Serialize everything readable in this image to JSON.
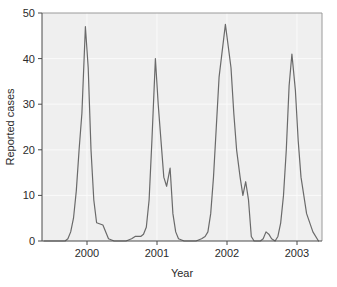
{
  "chart_data": {
    "type": "line",
    "title": "",
    "subtitle": "",
    "xlabel": "Year",
    "ylabel": "Reported cases",
    "xlim": [
      1999.55,
      2003.55
    ],
    "ylim": [
      0,
      50
    ],
    "grid": true,
    "legend": null,
    "legend_position": "none",
    "x_tick_labels": [
      "2000",
      "2001",
      "2002",
      "2003"
    ],
    "x_tick_values": [
      2000,
      2001,
      2002,
      2003
    ],
    "y_tick_labels": [
      "0",
      "10",
      "20",
      "30",
      "40",
      "50"
    ],
    "y_tick_values": [
      0,
      10,
      20,
      30,
      40,
      50
    ],
    "line_color": "#6a6a6a",
    "plot_background_color": "#efefef",
    "series": [
      {
        "name": "Reported cases",
        "x": [
          1999.58,
          1999.67,
          1999.75,
          1999.83,
          1999.88,
          1999.92,
          1999.96,
          2000.0,
          2000.04,
          2000.08,
          2000.12,
          2000.17,
          2000.21,
          2000.25,
          2000.29,
          2000.33,
          2000.42,
          2000.5,
          2000.58,
          2000.67,
          2000.75,
          2000.83,
          2000.88,
          2000.92,
          2000.96,
          2001.0,
          2001.04,
          2001.08,
          2001.12,
          2001.17,
          2001.21,
          2001.25,
          2001.29,
          2001.33,
          2001.38,
          2001.42,
          2001.46,
          2001.5,
          2001.58,
          2001.67,
          2001.75,
          2001.83,
          2001.88,
          2001.92,
          2001.96,
          2002.0,
          2002.04,
          2002.08,
          2002.17,
          2002.25,
          2002.29,
          2002.33,
          2002.38,
          2002.42,
          2002.46,
          2002.5,
          2002.54,
          2002.58,
          2002.62,
          2002.67,
          2002.71,
          2002.75,
          2002.79,
          2002.83,
          2002.88,
          2002.92,
          2002.96,
          2003.0,
          2003.04,
          2003.08,
          2003.12,
          2003.17,
          2003.21,
          2003.25,
          2003.33,
          2003.42,
          2003.5
        ],
        "y": [
          0,
          0,
          0,
          0,
          0,
          0.5,
          2,
          5,
          11,
          20,
          28,
          47,
          38,
          20,
          9,
          4,
          3.5,
          0.5,
          0,
          0,
          0,
          0.5,
          1,
          1,
          1,
          1.5,
          3,
          9,
          22,
          40,
          30,
          22,
          14,
          12,
          16,
          6,
          2,
          0.5,
          0,
          0,
          0,
          0.5,
          1,
          2,
          6,
          14,
          25,
          36,
          47.5,
          38,
          28,
          20,
          14,
          10,
          13,
          9,
          1,
          0,
          0,
          0,
          0.5,
          2,
          1.5,
          0.5,
          0,
          1,
          4,
          10,
          20,
          34,
          41,
          33,
          22,
          14,
          6,
          2,
          0
        ]
      }
    ],
    "peaks": [
      {
        "year": 2000.17,
        "value": 47
      },
      {
        "year": 2001.17,
        "value": 40
      },
      {
        "year": 2002.17,
        "value": 47.5
      },
      {
        "year": 2003.12,
        "value": 41
      }
    ],
    "secondary_shoulders": [
      {
        "year": 2001.38,
        "value": 16
      },
      {
        "year": 2002.46,
        "value": 13
      }
    ]
  }
}
